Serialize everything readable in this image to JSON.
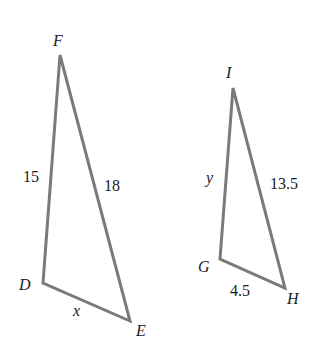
{
  "triangles": [
    {
      "name": "DEF",
      "vertices": {
        "F": "F",
        "D": "D",
        "E": "E"
      },
      "sides": {
        "FD": "15",
        "FE": "18",
        "DE": "x"
      }
    },
    {
      "name": "GHI",
      "vertices": {
        "I": "I",
        "G": "G",
        "H": "H"
      },
      "sides": {
        "IG": "y",
        "IH": "13.5",
        "GH": "4.5"
      }
    }
  ],
  "colors": {
    "edge": "#7a7a7a",
    "text": "#1a1a1a",
    "background": "#ffffff"
  }
}
